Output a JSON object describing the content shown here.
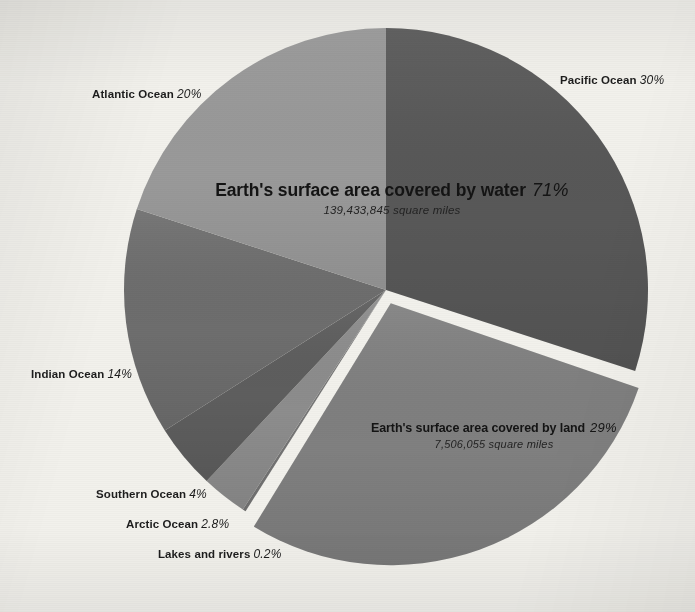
{
  "chart_data": {
    "type": "pie",
    "xlabel": "",
    "ylabel": "",
    "legend": "outside-callout-labels",
    "grid": false,
    "background_color": "#f2f1ec",
    "center": {
      "x": 386,
      "y": 290
    },
    "radius": 262,
    "start_angle_deg": 0,
    "direction": "clockwise",
    "categories": [
      "Pacific Ocean",
      "Earth's surface area covered by land",
      "Lakes and rivers",
      "Arctic Ocean",
      "Southern Ocean",
      "Indian Ocean",
      "Atlantic Ocean"
    ],
    "values": [
      30,
      29,
      0.2,
      2.8,
      4,
      14,
      20
    ],
    "slices": [
      {
        "label": "Pacific Ocean",
        "value": 30,
        "value_text": "30%",
        "color": "#585858",
        "group": "water",
        "exploded": false
      },
      {
        "label": "Earth's surface area covered by land",
        "value": 29,
        "value_text": "29%",
        "color": "#808080",
        "group": "land",
        "exploded": true
      },
      {
        "label": "Lakes and rivers",
        "value": 0.2,
        "value_text": "0.2%",
        "color": "#767676",
        "group": "water",
        "exploded": false
      },
      {
        "label": "Arctic Ocean",
        "value": 2.8,
        "value_text": "2.8%",
        "color": "#8d8d8d",
        "group": "water",
        "exploded": false
      },
      {
        "label": "Southern Ocean",
        "value": 4,
        "value_text": "4%",
        "color": "#5e5e5e",
        "group": "water",
        "exploded": false
      },
      {
        "label": "Indian Ocean",
        "value": 14,
        "value_text": "14%",
        "color": "#6e6e6e",
        "group": "water",
        "exploded": false
      },
      {
        "label": "Atlantic Ocean",
        "value": 20,
        "value_text": "20%",
        "color": "#9a9a9a",
        "group": "water",
        "exploded": false
      }
    ],
    "groups": [
      {
        "name": "water",
        "title": "Earth's surface area covered by water",
        "percent_text": "71%",
        "area_text": "139,433,845 square miles",
        "percent": 71
      },
      {
        "name": "land",
        "title": "Earth's surface area covered by land",
        "percent_text": "29%",
        "area_text": "7,506,055 square miles",
        "percent": 29
      }
    ]
  },
  "headlines": {
    "water": {
      "title": "Earth's surface area covered by water",
      "percent": "71%",
      "area": "139,433,845 square miles"
    },
    "land": {
      "title": "Earth's surface area covered by land",
      "percent": "29%",
      "area": "7,506,055 square miles"
    }
  },
  "callouts": {
    "pacific": {
      "name": "Pacific Ocean",
      "percent": "30%"
    },
    "atlantic": {
      "name": "Atlantic Ocean",
      "percent": "20%"
    },
    "indian": {
      "name": "Indian Ocean",
      "percent": "14%"
    },
    "southern": {
      "name": "Southern Ocean",
      "percent": "4%"
    },
    "arctic": {
      "name": "Arctic Ocean",
      "percent": "2.8%"
    },
    "lakes": {
      "name": "Lakes and rivers",
      "percent": "0.2%"
    }
  }
}
